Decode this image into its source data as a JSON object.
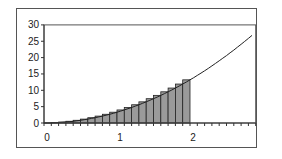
{
  "chart_data": {
    "type": "area",
    "title": "",
    "xlabel": "",
    "ylabel": "",
    "xlim": [
      0,
      2.9
    ],
    "ylim": [
      0,
      30
    ],
    "x_ticks": [
      "0",
      "1",
      "2"
    ],
    "y_ticks": [
      "0",
      "5",
      "10",
      "15",
      "20",
      "25",
      "30"
    ],
    "grid": false,
    "legend": null,
    "curve": {
      "name": "f(x)",
      "description": "smooth increasing curve approx y = 3.3 x^2",
      "x": [
        0,
        0.5,
        1.0,
        1.5,
        2.0,
        2.5,
        2.85
      ],
      "y": [
        0,
        0.8,
        3.3,
        7.4,
        13.2,
        20.6,
        26.8
      ]
    },
    "bars": {
      "name": "Riemann rectangles (right endpoint)",
      "bar_width": 0.1,
      "x_left": [
        0.0,
        0.1,
        0.2,
        0.3,
        0.4,
        0.5,
        0.6,
        0.7,
        0.8,
        0.9,
        1.0,
        1.1,
        1.2,
        1.3,
        1.4,
        1.5,
        1.6,
        1.7,
        1.8,
        1.9
      ],
      "heights": [
        0.03,
        0.13,
        0.3,
        0.53,
        0.83,
        1.19,
        1.62,
        2.11,
        2.67,
        3.3,
        3.99,
        4.75,
        5.58,
        6.47,
        7.43,
        8.45,
        9.54,
        10.69,
        11.91,
        13.2
      ],
      "fill": "#9a9a9a"
    }
  },
  "axis": {
    "x_labels": [
      {
        "v": 0,
        "t": "0"
      },
      {
        "v": 1,
        "t": "1"
      },
      {
        "v": 2,
        "t": "2"
      }
    ],
    "y_labels": [
      {
        "v": 0,
        "t": "0"
      },
      {
        "v": 5,
        "t": "5"
      },
      {
        "v": 10,
        "t": "10"
      },
      {
        "v": 15,
        "t": "15"
      },
      {
        "v": 20,
        "t": "20"
      },
      {
        "v": 25,
        "t": "25"
      },
      {
        "v": 30,
        "t": "30"
      }
    ]
  }
}
